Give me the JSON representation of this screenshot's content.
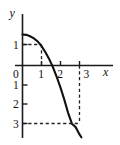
{
  "figure": {
    "name": "downward-parabola-graph",
    "background": "#ffffff",
    "stroke_color": "#111111",
    "width": 120,
    "height": 145
  },
  "chart_data": {
    "type": "line",
    "title": "",
    "xlabel": "x",
    "ylabel": "y",
    "xlim": [
      -0.35,
      3.85
    ],
    "ylim": [
      -3.75,
      1.95
    ],
    "grid": false,
    "legend": null,
    "x_ticks": [
      0,
      1,
      2,
      3
    ],
    "x_tick_labels": [
      "0",
      "1",
      "2",
      "3"
    ],
    "y_ticks": [
      1,
      0,
      -1,
      -2,
      -3
    ],
    "y_tick_labels": [
      "1",
      "0",
      "1",
      "2",
      "3"
    ],
    "annotations": [
      {
        "name": "dashed-guide-point-1",
        "kind": "dashed-guide",
        "x": 1,
        "y": 1,
        "horizontal_from_x": 0,
        "vertical_to_y": 0
      },
      {
        "name": "dashed-guide-point-2",
        "kind": "dashed-guide",
        "x": 2.8,
        "y": -3,
        "horizontal_from_x": 0,
        "vertical_to_y": 0
      }
    ],
    "series": [
      {
        "name": "curve",
        "style": "solid",
        "x": [
          0.0,
          0.2,
          0.4,
          0.6,
          0.8,
          1.0,
          1.2,
          1.4,
          1.6,
          1.8,
          2.0,
          2.2,
          2.4,
          2.6,
          2.8,
          3.0,
          3.1
        ],
        "y": [
          1.6,
          1.58,
          1.51,
          1.4,
          1.24,
          1.0,
          0.7,
          0.34,
          -0.08,
          -0.58,
          -1.14,
          -1.76,
          -2.44,
          -3.0,
          -3.18,
          -3.55,
          -3.7
        ]
      }
    ]
  },
  "labels": {
    "y_axis_name": "y",
    "x_axis_name": "x",
    "origin": "0",
    "y_pos_1": "1",
    "y_neg_1": "1",
    "y_neg_2": "2",
    "y_neg_3": "3",
    "x_1": "1",
    "x_2": "2",
    "x_3": "3"
  }
}
